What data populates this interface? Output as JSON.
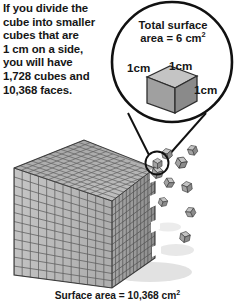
{
  "figure": {
    "kind": "geometry-illustration",
    "body_text": {
      "lines": [
        "If you divide the",
        "cube into smaller",
        "cubes that are",
        "1 cm on a side,",
        "you will have",
        "1,728 cubes and",
        "10,368 faces."
      ]
    },
    "callout": {
      "title_lines": [
        "Total surface",
        "area = 6 cm"
      ],
      "title_exponent": "2",
      "dimension_labels": {
        "left": "1cm",
        "top": "1cm",
        "right": "1cm"
      },
      "icon_names": {
        "circle": "callout-circle-icon",
        "cube": "unit-cube-icon",
        "leader_left": "leader-line-left-icon",
        "leader_right": "leader-line-right-icon",
        "highlight": "highlight-circle-icon"
      }
    },
    "caption": {
      "text": "Surface area = 10,368 cm",
      "exponent": "2"
    },
    "big_cube": {
      "icon_name": "subdivided-cube-icon",
      "divisions_per_edge": 12,
      "total_small_cubes": 1728,
      "total_faces": 10368,
      "unit_edge_label": "1 cm"
    },
    "loose_cubes": {
      "icon_name": "detached-unit-cubes-icon",
      "count": 9
    },
    "colors": {
      "outline": "#111111",
      "text": "#161616",
      "face_top": "#b0b0b0",
      "face_left": "#bcbcbc",
      "face_right": "#9a9a9a",
      "grid_line": "#5d5d5d",
      "callout_cube_top": "#c2c2c2",
      "callout_cube_left": "#9f9f9f",
      "callout_cube_right": "#8a8a8a",
      "shadow": "#d8d8d8",
      "background": "#ffffff"
    }
  }
}
